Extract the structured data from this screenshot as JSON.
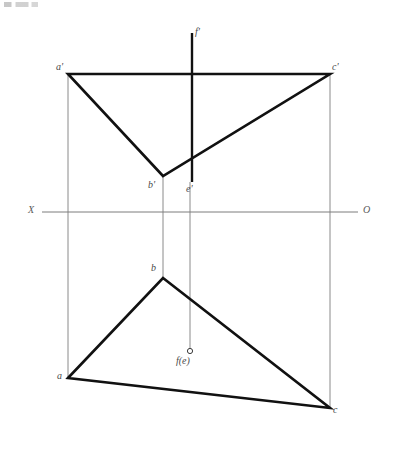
{
  "drawing": {
    "title": "Descriptive geometry two-view projection of triangle ABC with point E/F",
    "width": 403,
    "height": 470,
    "background_color": "#ffffff",
    "stroke_heavy_color": "#111111",
    "stroke_light_color": "#8a8a8a",
    "label_color": "#4a4a4a"
  },
  "axis": {
    "name": "ground-line",
    "left_label": "X",
    "right_label": "O",
    "y": 212,
    "x_start": 42,
    "x_end": 358,
    "left_label_x": 30,
    "left_label_y": 206,
    "right_label_x": 364,
    "right_label_y": 206
  },
  "front_view": {
    "name": "front-view-elevation",
    "points": {
      "a_prime": {
        "label": "a'",
        "x": 68,
        "y": 74,
        "label_x": 58,
        "label_y": 63
      },
      "c_prime": {
        "label": "c'",
        "x": 330,
        "y": 74,
        "label_x": 333,
        "label_y": 63
      },
      "b_prime": {
        "label": "b'",
        "x": 163,
        "y": 176,
        "label_x": 150,
        "label_y": 181
      },
      "e_prime": {
        "label": "e'",
        "x": 192,
        "y": 182,
        "label_x": 188,
        "label_y": 185
      },
      "f_prime": {
        "label": "f'",
        "x": 192,
        "y": 33,
        "label_x": 194,
        "label_y": 28
      }
    },
    "triangle_vertices": "68,74 330,74 163,176",
    "vertical_segment_top": {
      "x": 192,
      "y1": 33,
      "y2": 74
    },
    "vertical_segment_bottom": {
      "x": 192,
      "y1": 74,
      "y2": 182
    }
  },
  "top_view": {
    "name": "top-view-plan",
    "points": {
      "a": {
        "label": "a",
        "x": 68,
        "y": 378,
        "label_x": 58,
        "label_y": 372
      },
      "b": {
        "label": "b",
        "x": 163,
        "y": 278,
        "label_x": 152,
        "label_y": 264
      },
      "c": {
        "label": "c",
        "x": 330,
        "y": 408,
        "label_x": 333,
        "label_y": 406
      },
      "fe": {
        "label": "f(e)",
        "x": 190,
        "y": 351,
        "label_x": 178,
        "label_y": 357,
        "marker": "small-circle",
        "marker_radius": 2.5
      }
    },
    "triangle_vertices": "68,378 163,278 330,408"
  },
  "projection_lines": [
    {
      "name": "projector-a",
      "x": 68,
      "y1": 74,
      "y2": 378
    },
    {
      "name": "projector-b",
      "x": 163,
      "y1": 176,
      "y2": 278
    },
    {
      "name": "projector-c",
      "x": 330,
      "y1": 74,
      "y2": 408
    },
    {
      "name": "projector-ef",
      "x": 190,
      "y1": 182,
      "y2": 351
    }
  ]
}
